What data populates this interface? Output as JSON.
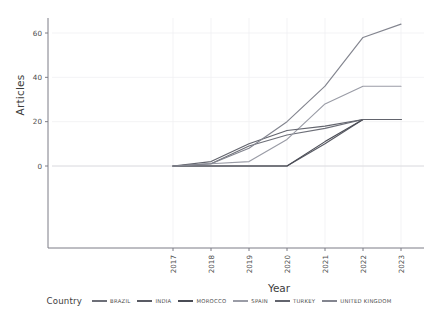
{
  "chart_data": {
    "type": "line",
    "title": "",
    "xlabel": "Year",
    "ylabel": "Articles",
    "x": [
      2017,
      2018,
      2019,
      2020,
      2021,
      2022,
      2023
    ],
    "xticklabels": [
      "2017",
      "2018",
      "2019",
      "2020",
      "2021",
      "2022",
      "2023"
    ],
    "yticklabels": [
      "0",
      "20",
      "40",
      "60"
    ],
    "yticks": [
      0,
      20,
      40,
      60
    ],
    "xlim": [
      2016.7,
      2023.3
    ],
    "ylim": [
      -28,
      68
    ],
    "grid": true,
    "legend_position": "bottom",
    "legend_title": "Country",
    "series": [
      {
        "name": "BRAZIL",
        "color": "#6d6f78",
        "values": [
          0,
          1,
          9,
          14,
          17,
          21,
          21
        ]
      },
      {
        "name": "INDIA",
        "color": "#595b64",
        "values": [
          0,
          0,
          0,
          0,
          10,
          21,
          21
        ]
      },
      {
        "name": "MOROCCO",
        "color": "#4a4c55",
        "values": [
          0,
          0,
          0,
          0,
          11,
          21,
          21
        ]
      },
      {
        "name": "SPAIN",
        "color": "#9a9ca6",
        "values": [
          0,
          1,
          2,
          12,
          28,
          36,
          36
        ]
      },
      {
        "name": "TURKEY",
        "color": "#62646d",
        "values": [
          0,
          2,
          10,
          16,
          18,
          21,
          21
        ]
      },
      {
        "name": "UNITED KINGDOM",
        "color": "#83858f",
        "values": [
          0,
          1,
          8,
          20,
          36,
          58,
          64
        ]
      }
    ]
  },
  "axis": {
    "y_title": "Articles",
    "x_title": "Year"
  },
  "legend": {
    "title": "Country",
    "items": [
      {
        "label": "BRAZIL",
        "color": "#6d6f78"
      },
      {
        "label": "INDIA",
        "color": "#595b64"
      },
      {
        "label": "MOROCCO",
        "color": "#4a4c55"
      },
      {
        "label": "SPAIN",
        "color": "#9a9ca6"
      },
      {
        "label": "TURKEY",
        "color": "#62646d"
      },
      {
        "label": "UNITED KINGDOM",
        "color": "#83858f"
      }
    ]
  }
}
